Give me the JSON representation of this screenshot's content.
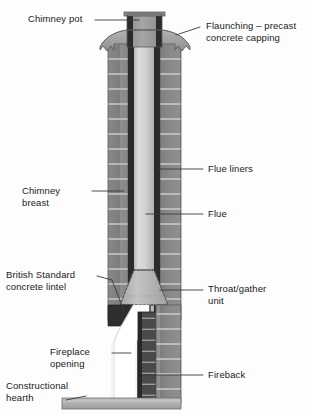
{
  "diagram": {
    "type": "architectural-cross-section",
    "colors": {
      "background": "#fdfdfd",
      "brickwork": "#8a8a8a",
      "brick_mortar": "#c9c9c9",
      "flue_liner_dark": "#2a2a2a",
      "flue_light": "#cfcfcf",
      "flaunching": "#a8a8a8",
      "chimney_pot": "#9a9a9a",
      "throat_unit": "#b5b5b5",
      "fireback": "#3a3a3a",
      "opening_white": "#ffffff",
      "hearth": "#b0b0b0",
      "leader_line": "#3a3a3a",
      "text": "#1b1b1b"
    }
  },
  "labels": {
    "chimney_pot": "Chimney pot",
    "flaunching": "Flaunching – precast\nconcrete capping",
    "flue_liners": "Flue liners",
    "chimney_breast": "Chimney\nbreast",
    "flue": "Flue",
    "british_standard_lintel": "British Standard\nconcrete lintel",
    "throat_gather_unit": "Throat/gather\nunit",
    "fireplace_opening": "Fireplace\nopening",
    "fireback": "Fireback",
    "constructional_hearth": "Constructional\nhearth"
  }
}
